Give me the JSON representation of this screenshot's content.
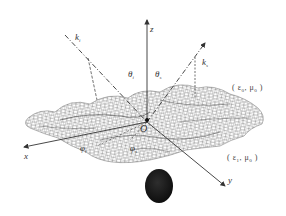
{
  "figure": {
    "colors": {
      "background": "#ffffff",
      "mesh": "#6a6a6a",
      "mesh_dark": "#2a2a2a",
      "axis": "#333333",
      "object": "#1a1a1a"
    }
  },
  "axes": {
    "x": {
      "label": "x"
    },
    "y": {
      "label": "y"
    },
    "z": {
      "label": "z"
    },
    "origin": {
      "label": "O"
    }
  },
  "vectors": {
    "incident": {
      "symbol": "k",
      "subscript": "i"
    },
    "scattered": {
      "symbol": "k",
      "subscript": "s"
    }
  },
  "angles": {
    "theta_i": {
      "symbol": "θ",
      "subscript": "i"
    },
    "theta_s": {
      "symbol": "θ",
      "subscript": "s"
    },
    "phi_i": {
      "symbol": "φ",
      "subscript": "i"
    },
    "phi_s": {
      "symbol": "φ",
      "subscript": "s"
    }
  },
  "media": {
    "upper": {
      "text": "( ε",
      "sub1": "0",
      "mid": ", μ",
      "sub2": "0",
      "end": " )"
    },
    "lower": {
      "text": "( ε",
      "sub1": "1",
      "mid": ", μ",
      "sub2": "0",
      "end": " )"
    }
  },
  "buried_object": {
    "shape": "ellipse",
    "fill": "dark"
  }
}
